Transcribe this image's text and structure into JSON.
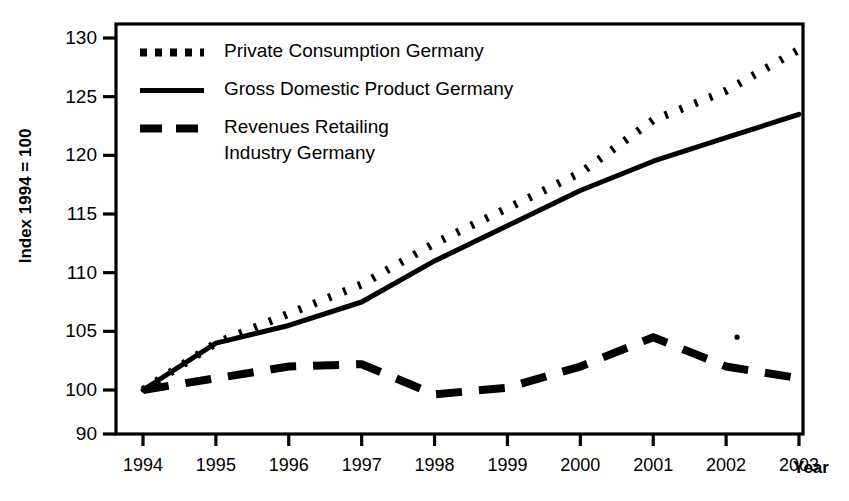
{
  "chart_data": {
    "type": "line",
    "title": "",
    "xlabel": "Year",
    "ylabel": "Index 1994 = 100",
    "categories": [
      "1994",
      "1995",
      "1996",
      "1997",
      "1998",
      "1999",
      "2000",
      "2001",
      "2002",
      "2003"
    ],
    "x": [
      1994,
      1995,
      1996,
      1997,
      1998,
      1999,
      2000,
      2001,
      2002,
      2003
    ],
    "xlim": [
      1994,
      2003
    ],
    "ylim": [
      90,
      130
    ],
    "yticks": [
      90,
      100,
      105,
      110,
      115,
      120,
      125,
      130
    ],
    "ytick_labels": [
      "90",
      "100",
      "105",
      "110",
      "115",
      "120",
      "125",
      "130"
    ],
    "axis_break_note": "y-axis is broken between 90 and 100",
    "grid": false,
    "legend_position": "upper-left-inside",
    "series": [
      {
        "name": "Private Consumption Germany",
        "style": "dotted",
        "color": "#000000",
        "values": [
          100,
          104,
          106.5,
          109,
          112.5,
          115.5,
          118.5,
          123,
          125.5,
          129
        ]
      },
      {
        "name": "Gross Domestic Product Germany",
        "style": "solid",
        "color": "#000000",
        "values": [
          100,
          104,
          105.5,
          107.5,
          111,
          114,
          117,
          119.5,
          121.5,
          123.5
        ]
      },
      {
        "name": "Revenues Retailing\nIndustry Germany",
        "style": "dashed",
        "color": "#000000",
        "values": [
          100,
          101,
          102,
          102.2,
          99,
          100.2,
          102,
          104.5,
          102,
          101
        ]
      }
    ],
    "annotations": [
      {
        "label": "stray-dot",
        "x": 2002.15,
        "y": 104.5
      }
    ]
  },
  "legend": {
    "items": [
      {
        "label": "Private Consumption Germany",
        "style": "dotted"
      },
      {
        "label": "Gross Domestic Product Germany",
        "style": "solid"
      },
      {
        "label": "Revenues Retailing\nIndustry Germany",
        "style": "dashed"
      }
    ]
  },
  "axes": {
    "y_title": "Index 1994 = 100",
    "x_title": "Year"
  }
}
